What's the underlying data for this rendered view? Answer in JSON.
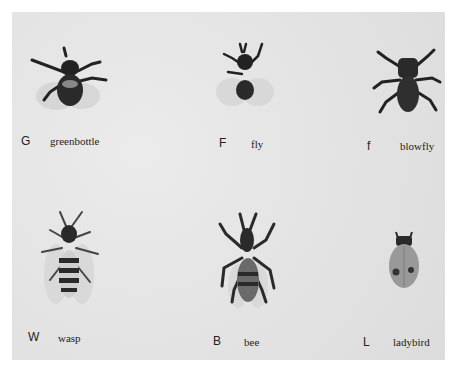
{
  "specimens": [
    {
      "letter": "G",
      "name": "greenbottle"
    },
    {
      "letter": "F",
      "name": "fly"
    },
    {
      "letter": "f",
      "name": "blowfly"
    },
    {
      "letter": "W",
      "name": "wasp"
    },
    {
      "letter": "B",
      "name": "bee"
    },
    {
      "letter": "L",
      "name": "ladybird"
    }
  ]
}
